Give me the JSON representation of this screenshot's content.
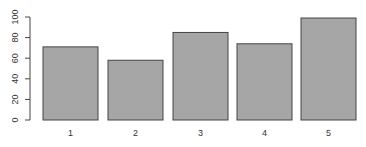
{
  "chart_data": {
    "type": "bar",
    "title": "",
    "xlabel": "",
    "ylabel": "",
    "categories": [
      "1",
      "2",
      "3",
      "4",
      "5"
    ],
    "values": [
      71,
      58,
      85,
      74,
      99
    ],
    "ylim": [
      0,
      100
    ],
    "yticks": [
      0,
      20,
      40,
      60,
      80,
      100
    ],
    "grid": false,
    "legend": null,
    "bar_color": "#a6a6a6",
    "bar_border_color": "#444444"
  }
}
